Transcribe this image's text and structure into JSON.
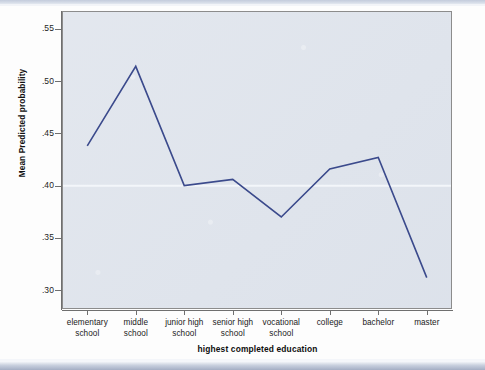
{
  "chart_data": {
    "type": "line",
    "title": "",
    "xlabel": "highest completed education",
    "ylabel": "Mean Predicted probability",
    "categories": [
      "elementary school",
      "middle school",
      "junior high school",
      "senior high school",
      "vocational school",
      "college",
      "bachelor",
      "master"
    ],
    "category_lines": [
      [
        "elementary",
        "school"
      ],
      [
        "middle",
        "school"
      ],
      [
        "junior high",
        "school"
      ],
      [
        "senior high",
        "school"
      ],
      [
        "vocational",
        "school"
      ],
      [
        "college",
        ""
      ],
      [
        "bachelor",
        ""
      ],
      [
        "master",
        ""
      ]
    ],
    "values": [
      0.438,
      0.514,
      0.4,
      0.406,
      0.37,
      0.416,
      0.427,
      0.312
    ],
    "series": [
      {
        "name": "Mean Predicted probability",
        "values": [
          0.438,
          0.514,
          0.4,
          0.406,
          0.37,
          0.416,
          0.427,
          0.312
        ]
      }
    ],
    "ylim": [
      0.283,
      0.566
    ],
    "yticks": [
      0.3,
      0.35,
      0.4,
      0.45,
      0.5,
      0.55
    ],
    "ytick_labels": [
      ".30",
      ".35",
      ".40",
      ".45",
      ".50",
      ".55"
    ],
    "grid": "horizontal-faint-at-.40",
    "legend": "none",
    "line_color": "#3b4a8c",
    "plot_background": "#dfe4ec",
    "frame_color": "#8c8c8c"
  },
  "axes": {
    "y_title": "Mean Predicted probability",
    "x_title": "highest completed education"
  }
}
